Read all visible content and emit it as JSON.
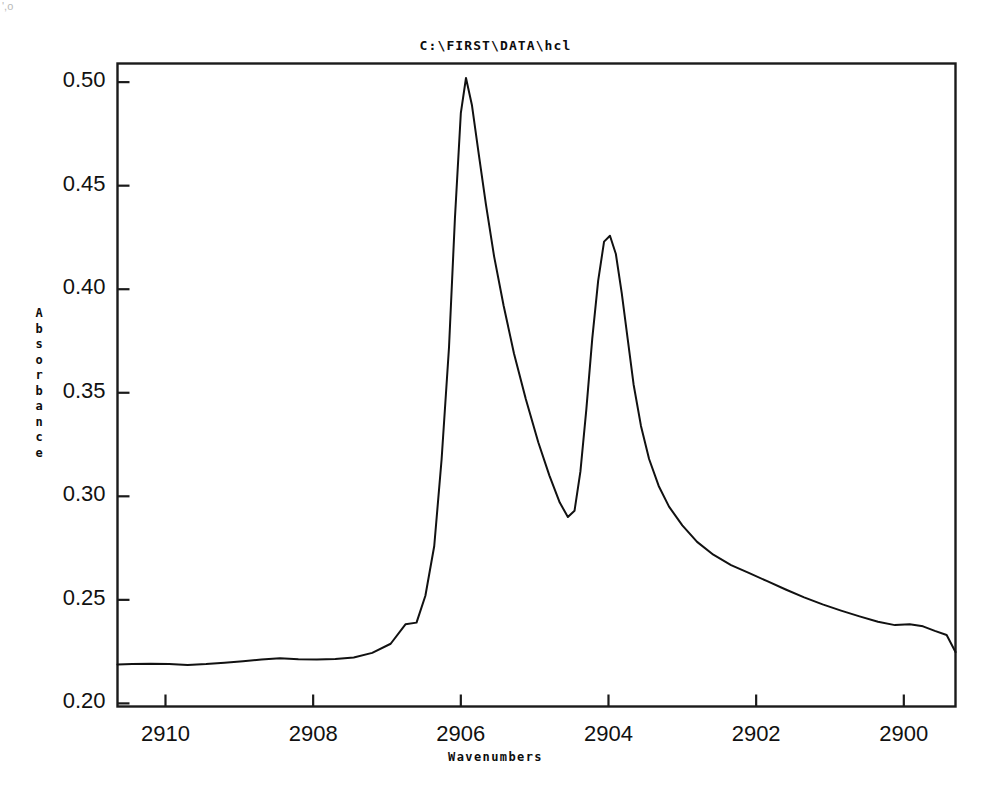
{
  "chart_data": {
    "type": "line",
    "title": "C:\\FIRST\\DATA\\hcl",
    "xlabel": "Wavenumbers",
    "ylabel": "Absorbance",
    "xlim": [
      2910.65,
      2899.3
    ],
    "ylim": [
      0.1985,
      0.509
    ],
    "x_inverted": true,
    "grid": false,
    "legend": "none",
    "xticks": [
      2910,
      2908,
      2906,
      2904,
      2902,
      2900
    ],
    "xtick_labels": [
      "2910",
      "2908",
      "2906",
      "2904",
      "2902",
      "2900"
    ],
    "yticks": [
      0.2,
      0.25,
      0.3,
      0.35,
      0.4,
      0.45,
      0.5
    ],
    "ytick_labels": [
      "0.20",
      "0.25",
      "0.30",
      "0.35",
      "0.40",
      "0.45",
      "0.50"
    ],
    "line_color": "#111111",
    "line_width": 2.0,
    "series": [
      {
        "name": "hcl absorbance spectrum",
        "x": [
          2910.65,
          2910.45,
          2910.2,
          2909.95,
          2909.7,
          2909.45,
          2909.2,
          2908.95,
          2908.7,
          2908.45,
          2908.2,
          2907.95,
          2907.7,
          2907.45,
          2907.2,
          2906.95,
          2906.75,
          2906.6,
          2906.48,
          2906.36,
          2906.26,
          2906.16,
          2906.08,
          2906.0,
          2905.93,
          2905.85,
          2905.76,
          2905.66,
          2905.55,
          2905.42,
          2905.28,
          2905.12,
          2904.95,
          2904.8,
          2904.66,
          2904.55,
          2904.46,
          2904.38,
          2904.3,
          2904.22,
          2904.14,
          2904.06,
          2903.98,
          2903.9,
          2903.82,
          2903.74,
          2903.66,
          2903.56,
          2903.45,
          2903.32,
          2903.18,
          2903.0,
          2902.8,
          2902.58,
          2902.34,
          2902.1,
          2901.85,
          2901.6,
          2901.35,
          2901.1,
          2900.85,
          2900.6,
          2900.35,
          2900.12,
          2899.92,
          2899.74,
          2899.58,
          2899.42,
          2899.3
        ],
        "y": [
          0.2188,
          0.219,
          0.2192,
          0.219,
          0.2186,
          0.219,
          0.2196,
          0.2204,
          0.2212,
          0.2218,
          0.2213,
          0.2212,
          0.2214,
          0.2222,
          0.2244,
          0.2288,
          0.2382,
          0.239,
          0.252,
          0.276,
          0.318,
          0.372,
          0.434,
          0.485,
          0.502,
          0.489,
          0.466,
          0.441,
          0.416,
          0.392,
          0.369,
          0.347,
          0.326,
          0.31,
          0.297,
          0.29,
          0.293,
          0.312,
          0.342,
          0.376,
          0.404,
          0.423,
          0.4258,
          0.417,
          0.398,
          0.376,
          0.354,
          0.334,
          0.318,
          0.305,
          0.295,
          0.286,
          0.278,
          0.2718,
          0.2668,
          0.263,
          0.259,
          0.255,
          0.2512,
          0.2478,
          0.2448,
          0.242,
          0.2394,
          0.2378,
          0.2382,
          0.2372,
          0.235,
          0.233,
          0.2248
        ]
      }
    ],
    "annotations": {
      "peak_1": {
        "x": 2905.93,
        "y": 0.502,
        "label": ""
      },
      "peak_2": {
        "x": 2903.98,
        "y": 0.426,
        "label": ""
      },
      "valley": {
        "x": 2904.55,
        "y": 0.29,
        "label": ""
      }
    }
  },
  "figure": {
    "background_color": "#ffffff",
    "frame_color": "#1a1a1a",
    "scan_artifact": "',o"
  }
}
